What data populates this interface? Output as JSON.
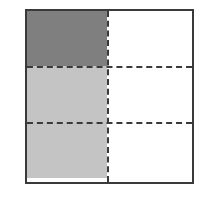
{
  "diagram": {
    "columns": 2,
    "rows": 3,
    "cells": [
      {
        "row": 0,
        "col": 0,
        "fill": "#7f7f7f",
        "shade": "dark"
      },
      {
        "row": 1,
        "col": 0,
        "fill": "#c4c4c4",
        "shade": "light"
      },
      {
        "row": 2,
        "col": 0,
        "fill": "#c4c4c4",
        "shade": "light"
      },
      {
        "row": 0,
        "col": 1,
        "fill": "#ffffff",
        "shade": "none"
      },
      {
        "row": 1,
        "col": 1,
        "fill": "#ffffff",
        "shade": "none"
      },
      {
        "row": 2,
        "col": 1,
        "fill": "#ffffff",
        "shade": "none"
      }
    ],
    "colors": {
      "border": "#3a3a3a",
      "dark_shade": "#7f7f7f",
      "light_shade": "#c4c4c4",
      "background": "#ffffff"
    }
  }
}
